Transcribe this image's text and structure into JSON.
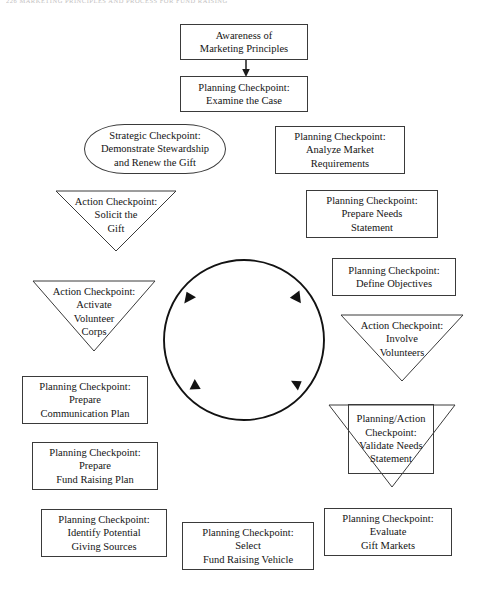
{
  "page": {
    "running_head": "226  MARKETING PRINCIPLES AND PROCESS FOR FUND RAISING",
    "width": 487,
    "height": 599,
    "background": "#ffffff",
    "ink_color": "#3a3a3a"
  },
  "diagram": {
    "type": "cycle-flowchart",
    "center": {
      "name": "cycle-circle",
      "description": "Clockwise circular arrow loop at the center of the diagram",
      "arrow_count": 4,
      "direction": "clockwise"
    },
    "nodes": [
      {
        "id": "awareness",
        "shape": "rectangle",
        "lines": [
          "Awareness of",
          "Marketing Principles"
        ],
        "x": 180,
        "y": 24,
        "w": 128,
        "h": 36
      },
      {
        "id": "examine-case",
        "shape": "rectangle",
        "lines": [
          "Planning Checkpoint:",
          "Examine the Case"
        ],
        "x": 180,
        "y": 76,
        "w": 128,
        "h": 36
      },
      {
        "id": "analyze-market",
        "shape": "rectangle",
        "lines": [
          "Planning Checkpoint:",
          "Analyze Market",
          "Requirements"
        ],
        "x": 275,
        "y": 126,
        "w": 130,
        "h": 48
      },
      {
        "id": "demonstrate-stewardship",
        "shape": "rounded",
        "lines": [
          "Strategic Checkpoint:",
          "Demonstrate Stewardship",
          "and Renew the Gift"
        ],
        "x": 84,
        "y": 124,
        "w": 142,
        "h": 50
      },
      {
        "id": "prepare-needs-statement",
        "shape": "rectangle",
        "lines": [
          "Planning Checkpoint:",
          "Prepare Needs",
          "Statement"
        ],
        "x": 306,
        "y": 190,
        "w": 132,
        "h": 48
      },
      {
        "id": "solicit-gift",
        "shape": "triangle-down",
        "lines": [
          "Action Checkpoint:",
          "Solicit the",
          "Gift"
        ],
        "x": 55,
        "y": 190,
        "w": 122,
        "h": 62
      },
      {
        "id": "define-objectives",
        "shape": "rectangle",
        "lines": [
          "Planning Checkpoint:",
          "Define Objectives"
        ],
        "x": 332,
        "y": 258,
        "w": 124,
        "h": 38
      },
      {
        "id": "activate-volunteer-corps",
        "shape": "triangle-down",
        "lines": [
          "Action Checkpoint:",
          "Activate",
          "Volunteer",
          "Corps"
        ],
        "x": 32,
        "y": 280,
        "w": 124,
        "h": 72
      },
      {
        "id": "involve-volunteers",
        "shape": "triangle-down",
        "lines": [
          "Action Checkpoint:",
          "Involve",
          "Volunteers"
        ],
        "x": 340,
        "y": 314,
        "w": 124,
        "h": 68
      },
      {
        "id": "prepare-communication-plan",
        "shape": "rectangle",
        "lines": [
          "Planning Checkpoint:",
          "Prepare",
          "Communication Plan"
        ],
        "x": 22,
        "y": 376,
        "w": 126,
        "h": 48
      },
      {
        "id": "validate-needs-statement",
        "shape": "rectangle-with-triangle",
        "lines": [
          "Planning/Action",
          "Checkpoint:",
          "Validate Needs",
          "Statement"
        ],
        "x": 348,
        "y": 404,
        "w": 86,
        "h": 70,
        "triangle": {
          "x": 328,
          "y": 404,
          "w": 128,
          "h": 84
        }
      },
      {
        "id": "prepare-fund-raising-plan",
        "shape": "rectangle",
        "lines": [
          "Planning Checkpoint:",
          "Prepare",
          "Fund Raising Plan"
        ],
        "x": 32,
        "y": 442,
        "w": 126,
        "h": 48
      },
      {
        "id": "evaluate-gift-markets",
        "shape": "rectangle",
        "lines": [
          "Planning Checkpoint:",
          "Evaluate",
          "Gift Markets"
        ],
        "x": 324,
        "y": 508,
        "w": 128,
        "h": 48
      },
      {
        "id": "identify-potential-giving-sources",
        "shape": "rectangle",
        "lines": [
          "Planning Checkpoint:",
          "Identify Potential",
          "Giving Sources"
        ],
        "x": 41,
        "y": 509,
        "w": 126,
        "h": 48
      },
      {
        "id": "select-fund-raising-vehicle",
        "shape": "rectangle",
        "lines": [
          "Planning Checkpoint:",
          "Select",
          "Fund Raising Vehicle"
        ],
        "x": 182,
        "y": 522,
        "w": 132,
        "h": 48
      }
    ],
    "connectors": [
      {
        "id": "awareness-to-examine",
        "from": "awareness",
        "to": "examine-case",
        "style": "straight-arrow-down"
      }
    ]
  }
}
